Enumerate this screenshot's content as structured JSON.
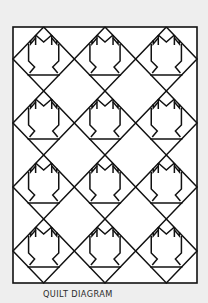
{
  "diagram": {
    "caption": "QUILT DIAGRAM",
    "grid": {
      "rows": 4,
      "columns": 3
    },
    "motif": "tulip-block",
    "block_count": 12,
    "colors": {
      "background": "#eeeeee",
      "quilt_fill": "#ffffff",
      "line": "#111111",
      "caption": "#2a2a2a"
    }
  }
}
